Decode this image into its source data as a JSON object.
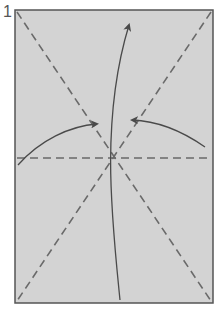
{
  "step": {
    "number": "1"
  },
  "colors": {
    "paper_fill": "#d3d3d3",
    "paper_edge": "#555555",
    "fold_line": "#6a6a6a",
    "arrow": "#4a4a4a",
    "background": "#ffffff"
  },
  "paper": {
    "x": 15,
    "y": 10,
    "width": 198,
    "height": 293
  },
  "fold_lines": [
    {
      "name": "valley-fold-diagonal-tl-br",
      "x1": 17,
      "y1": 12,
      "x2": 211,
      "y2": 301,
      "style": "dashed"
    },
    {
      "name": "valley-fold-diagonal-tr-bl",
      "x1": 211,
      "y1": 12,
      "x2": 17,
      "y2": 301,
      "style": "dashed"
    },
    {
      "name": "valley-fold-horizontal-mid",
      "x1": 17,
      "y1": 158,
      "x2": 211,
      "y2": 158,
      "style": "dashed"
    }
  ],
  "arrows": [
    {
      "name": "fold-up-arrow",
      "path": "M120,300 C112,220 100,120 129,25",
      "head": {
        "x": 130,
        "y": 22
      }
    },
    {
      "name": "fold-left-edge-arrow",
      "path": "M18,165 C40,140 70,126 97,124",
      "head": {
        "x": 99,
        "y": 124
      }
    },
    {
      "name": "fold-right-edge-arrow",
      "path": "M205,147 C185,133 160,121 132,120",
      "head": {
        "x": 130,
        "y": 120
      }
    }
  ]
}
